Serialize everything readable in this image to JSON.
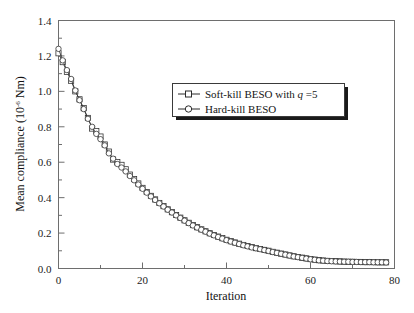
{
  "chart_data": {
    "type": "line",
    "title": "",
    "xlabel": "Iteration",
    "ylabel": "Mean compliance (10-6 Nm)",
    "ylabel_prefix": "Mean compliance (10",
    "ylabel_exponent": "-6",
    "ylabel_suffix": " Nm)",
    "xlim": [
      0,
      80
    ],
    "ylim": [
      0,
      1.4
    ],
    "xticks": [
      0,
      20,
      40,
      60,
      80
    ],
    "xtick_labels": [
      "0",
      "20",
      "40",
      "60",
      "80"
    ],
    "xminor_step": 10,
    "yticks": [
      0.0,
      0.2,
      0.4,
      0.6,
      0.8,
      1.0,
      1.2,
      1.4
    ],
    "ytick_labels": [
      "0.0",
      "0.2",
      "0.4",
      "0.6",
      "0.8",
      "1.0",
      "1.2",
      "1.4"
    ],
    "yminor_step": 0.1,
    "grid": false,
    "legend_position": "center-right-upper",
    "series": [
      {
        "name": "Soft-kill BESO with q =5",
        "name_prefix": "Soft-kill BESO with ",
        "name_italic": "q",
        "name_suffix": " =5",
        "marker": "square",
        "color": "#2b2b2b",
        "x": [
          0,
          1,
          2,
          3,
          4,
          5,
          6,
          7,
          8,
          9,
          10,
          11,
          12,
          13,
          14,
          15,
          16,
          17,
          18,
          19,
          20,
          21,
          22,
          23,
          24,
          25,
          26,
          27,
          28,
          29,
          30,
          31,
          32,
          33,
          34,
          35,
          36,
          37,
          38,
          39,
          40,
          41,
          42,
          43,
          44,
          45,
          46,
          47,
          48,
          49,
          50,
          51,
          52,
          53,
          54,
          55,
          56,
          57,
          58,
          59,
          60,
          61,
          62,
          63,
          64,
          65,
          66,
          67,
          68,
          69,
          70,
          71,
          72,
          73,
          74,
          75,
          76,
          77,
          78
        ],
        "y": [
          1.215,
          1.165,
          1.11,
          1.06,
          1.0,
          0.955,
          0.905,
          0.85,
          0.79,
          0.775,
          0.745,
          0.7,
          0.66,
          0.615,
          0.6,
          0.585,
          0.56,
          0.53,
          0.505,
          0.48,
          0.455,
          0.432,
          0.41,
          0.39,
          0.37,
          0.352,
          0.334,
          0.318,
          0.302,
          0.287,
          0.272,
          0.258,
          0.245,
          0.233,
          0.221,
          0.21,
          0.199,
          0.189,
          0.18,
          0.171,
          0.162,
          0.154,
          0.147,
          0.14,
          0.133,
          0.127,
          0.121,
          0.115,
          0.11,
          0.105,
          0.1,
          0.094,
          0.089,
          0.084,
          0.079,
          0.074,
          0.069,
          0.065,
          0.061,
          0.057,
          0.053,
          0.05,
          0.047,
          0.045,
          0.043,
          0.042,
          0.041,
          0.04,
          0.039,
          0.038,
          0.038,
          0.037,
          0.037,
          0.036,
          0.036,
          0.036,
          0.035,
          0.035,
          0.035
        ]
      },
      {
        "name": "Hard-kill BESO",
        "marker": "circle",
        "color": "#2b2b2b",
        "x": [
          0,
          1,
          2,
          3,
          4,
          5,
          6,
          7,
          8,
          9,
          10,
          11,
          12,
          13,
          14,
          15,
          16,
          17,
          18,
          19,
          20,
          21,
          22,
          23,
          24,
          25,
          26,
          27,
          28,
          29,
          30,
          31,
          32,
          33,
          34,
          35,
          36,
          37,
          38,
          39,
          40,
          41,
          42,
          43,
          44,
          45,
          46,
          47,
          48,
          49,
          50,
          51,
          52,
          53,
          54,
          55,
          56,
          57,
          58,
          59,
          60,
          61,
          62,
          63,
          64,
          65,
          66,
          67,
          68,
          69,
          70,
          71,
          72,
          73,
          74,
          75,
          76,
          77,
          78
        ],
        "y": [
          1.24,
          1.175,
          1.12,
          1.07,
          1.005,
          0.95,
          0.9,
          0.845,
          0.8,
          0.76,
          0.73,
          0.695,
          0.65,
          0.62,
          0.59,
          0.57,
          0.548,
          0.522,
          0.498,
          0.474,
          0.45,
          0.428,
          0.407,
          0.387,
          0.368,
          0.35,
          0.332,
          0.316,
          0.3,
          0.285,
          0.27,
          0.256,
          0.243,
          0.231,
          0.219,
          0.208,
          0.197,
          0.187,
          0.178,
          0.169,
          0.16,
          0.152,
          0.145,
          0.138,
          0.131,
          0.125,
          0.119,
          0.114,
          0.109,
          0.104,
          0.099,
          0.093,
          0.088,
          0.083,
          0.078,
          0.073,
          0.068,
          0.064,
          0.06,
          0.056,
          0.052,
          0.049,
          0.046,
          0.044,
          0.042,
          0.041,
          0.04,
          0.039,
          0.038,
          0.038,
          0.037,
          0.037,
          0.036,
          0.036,
          0.036,
          0.035,
          0.035,
          0.035,
          0.034
        ]
      }
    ]
  }
}
